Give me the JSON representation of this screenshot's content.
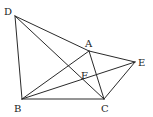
{
  "diagram": {
    "type": "geometry",
    "points": {
      "D": {
        "x": 15,
        "y": 16,
        "label": "D",
        "lx": 4,
        "ly": 15
      },
      "A": {
        "x": 89,
        "y": 51,
        "label": "A",
        "lx": 85,
        "ly": 47
      },
      "E": {
        "x": 135,
        "y": 62,
        "label": "E",
        "lx": 138,
        "ly": 66
      },
      "F": {
        "label": "F",
        "lx": 81,
        "ly": 79
      },
      "B": {
        "x": 22,
        "y": 99,
        "label": "B",
        "lx": 14,
        "ly": 112
      },
      "C": {
        "x": 104,
        "y": 99,
        "label": "C",
        "lx": 101,
        "ly": 112
      }
    },
    "segments": [
      [
        "D",
        "B"
      ],
      [
        "D",
        "A"
      ],
      [
        "A",
        "E"
      ],
      [
        "D",
        "C"
      ],
      [
        "B",
        "C"
      ],
      [
        "B",
        "A"
      ],
      [
        "B",
        "E"
      ],
      [
        "A",
        "C"
      ],
      [
        "C",
        "E"
      ]
    ],
    "labels": {
      "D": "D",
      "A": "A",
      "E": "E",
      "F": "F",
      "B": "B",
      "C": "C"
    }
  }
}
